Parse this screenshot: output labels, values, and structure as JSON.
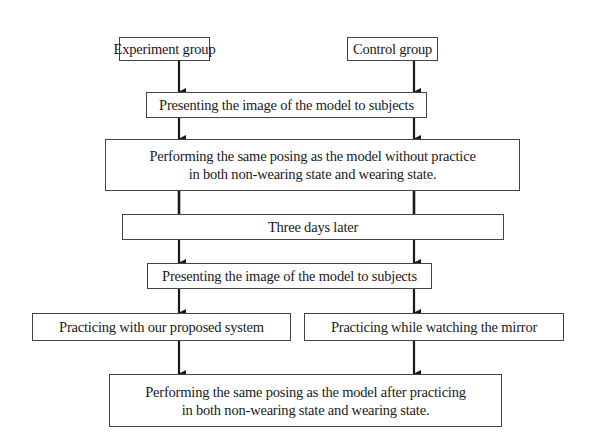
{
  "diagram": {
    "type": "flowchart",
    "nodes": {
      "experiment_group": {
        "label": "Experiment group"
      },
      "control_group": {
        "label": "Control group"
      },
      "present_image_1": {
        "label": "Presenting the image of the model to subjects"
      },
      "perform_without_practice": {
        "line1": "Performing the same posing as the model without practice",
        "line2": "in both non-wearing state and wearing state."
      },
      "three_days_later": {
        "label": "Three days later"
      },
      "present_image_2": {
        "label": "Presenting the image of the model to subjects"
      },
      "practice_system": {
        "label": "Practicing with our proposed system"
      },
      "practice_mirror": {
        "label": "Practicing while watching the mirror"
      },
      "perform_after_practice": {
        "line1": "Performing the same posing as the model after practicing",
        "line2": "in both non-wearing state and wearing state."
      }
    },
    "edges": [
      {
        "from": "experiment_group",
        "to": "present_image_1"
      },
      {
        "from": "control_group",
        "to": "present_image_1"
      },
      {
        "from": "present_image_1",
        "to": "perform_without_practice"
      },
      {
        "from": "perform_without_practice",
        "to": "three_days_later"
      },
      {
        "from": "three_days_later",
        "to": "present_image_2"
      },
      {
        "from": "present_image_2",
        "to": "practice_system"
      },
      {
        "from": "present_image_2",
        "to": "practice_mirror"
      },
      {
        "from": "practice_system",
        "to": "perform_after_practice"
      },
      {
        "from": "practice_mirror",
        "to": "perform_after_practice"
      }
    ],
    "colors": {
      "line": "#1a1a1a",
      "border": "#444444",
      "background": "#ffffff"
    }
  }
}
